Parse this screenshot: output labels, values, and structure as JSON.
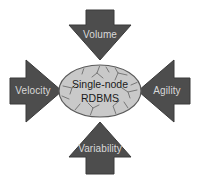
{
  "diagram": {
    "type": "pressure-arrows-on-center",
    "background_color": "#ffffff",
    "arrow_fill": "#4d4d4d",
    "arrow_stroke": "#3a3a3a",
    "arrow_label_color": "#d9d9d9",
    "core": {
      "shape": "ellipse",
      "fill": "#c9c9c9",
      "stroke": "#5a5a5a",
      "texture": "cracked",
      "line1": "Single-node",
      "line2": "RDBMS",
      "text_color": "#1a1a1a"
    },
    "arrows": [
      {
        "id": "volume",
        "label": "Volume",
        "position": "top",
        "points": "down"
      },
      {
        "id": "velocity",
        "label": "Velocity",
        "position": "left",
        "points": "right"
      },
      {
        "id": "agility",
        "label": "Agility",
        "position": "right",
        "points": "left"
      },
      {
        "id": "variability",
        "label": "Variability",
        "position": "bottom",
        "points": "up"
      }
    ]
  }
}
